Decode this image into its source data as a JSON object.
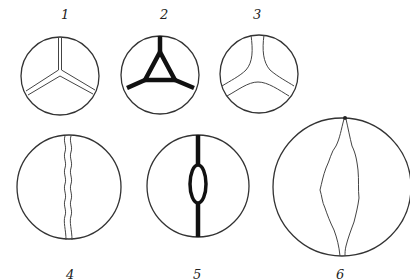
{
  "figure": {
    "panels": [
      {
        "label": "1",
        "style": "double thin lines meeting at center (Y-junction)",
        "stroke_color": "#444444"
      },
      {
        "label": "2",
        "style": "thick black triangle with three radial arms",
        "stroke_color": "#111111"
      },
      {
        "label": "3",
        "style": "double curved lines forming rounded three-way junction",
        "stroke_color": "#444444"
      },
      {
        "label": "4",
        "style": "vertical wavy double line",
        "stroke_color": "#444444"
      },
      {
        "label": "5",
        "style": "thick vertical line with elongated oval loop at center",
        "stroke_color": "#111111"
      },
      {
        "label": "6",
        "style": "large circle with wavy spindle-shaped lens from top to bottom",
        "stroke_color": "#444444"
      }
    ]
  },
  "colors": {
    "background": "#ffffff",
    "ink": "#222222"
  }
}
